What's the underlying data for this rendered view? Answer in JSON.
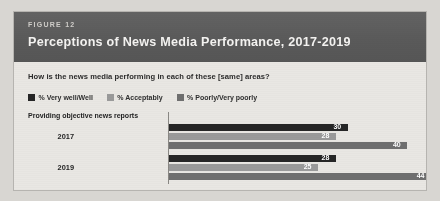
{
  "figure": {
    "kicker": "FIGURE 12",
    "title": "Perceptions of News Media Performance, 2017-2019",
    "subtitle": "How is the news media performing in each of these [same] areas?"
  },
  "legend": {
    "items": [
      {
        "label": "% Very well/Well",
        "color": "#262626"
      },
      {
        "label": "% Acceptably",
        "color": "#9a9a9a"
      },
      {
        "label": "% Poorly/Very poorly",
        "color": "#6f6f6f"
      }
    ]
  },
  "chart_data": {
    "type": "bar",
    "orientation": "horizontal",
    "title": "Perceptions of News Media Performance, 2017-2019",
    "subtitle": "How is the news media performing in each of these [same] areas?",
    "category_label": "Providing objective news reports",
    "categories": [
      "2017",
      "2019"
    ],
    "xlabel": "",
    "ylabel": "",
    "xlim": [
      0,
      46
    ],
    "grid": false,
    "legend_position": "top-left",
    "series": [
      {
        "name": "% Very well/Well",
        "color": "#262626",
        "values": [
          30,
          28
        ]
      },
      {
        "name": "% Acceptably",
        "color": "#9a9a9a",
        "values": [
          28,
          25
        ]
      },
      {
        "name": "% Poorly/Very poorly",
        "color": "#6f6f6f",
        "values": [
          40,
          44
        ]
      }
    ],
    "groups": [
      {
        "year": "2017",
        "bars": [
          {
            "series": "% Very well/Well",
            "value": 30,
            "label": "30",
            "color": "#262626"
          },
          {
            "series": "% Acceptably",
            "value": 28,
            "label": "28",
            "color": "#9a9a9a"
          },
          {
            "series": "% Poorly/Very poorly",
            "value": 40,
            "label": "40",
            "color": "#6f6f6f"
          }
        ]
      },
      {
        "year": "2019",
        "bars": [
          {
            "series": "% Very well/Well",
            "value": 28,
            "label": "28",
            "color": "#262626"
          },
          {
            "series": "% Acceptably",
            "value": 25,
            "label": "25",
            "color": "#9a9a9a"
          },
          {
            "series": "% Poorly/Very poorly",
            "value": 44,
            "label": "44",
            "color": "#6f6f6f"
          }
        ]
      }
    ]
  }
}
